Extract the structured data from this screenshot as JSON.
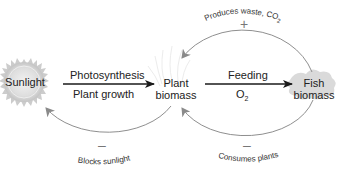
{
  "nodes": {
    "sunlight": {
      "label": "Sunlight"
    },
    "plant": {
      "line1": "Plant",
      "line2": "biomass"
    },
    "fish": {
      "line1": "Fish",
      "line2": "biomass"
    }
  },
  "arrows": {
    "sun_to_plant": {
      "top": "Photosynthesis",
      "bottom": "Plant growth"
    },
    "plant_to_fish": {
      "top": "Feeding",
      "bottom_base": "O",
      "bottom_sub": "2"
    }
  },
  "feedback": {
    "fish_to_plant_top": {
      "label": "Produces waste, CO",
      "sub": "2",
      "sign": "+"
    },
    "plant_to_sun_bottom": {
      "label": "Blocks sunlight",
      "sign": "–"
    },
    "fish_to_plant_bottom": {
      "label": "Consumes plants",
      "sign": "–"
    }
  },
  "colors": {
    "main_arrow": "#1a1a1a",
    "feedback_arrow": "#999999",
    "sun": "#cfcfcf",
    "fish": "#d8d8d8",
    "text": "#222222"
  }
}
